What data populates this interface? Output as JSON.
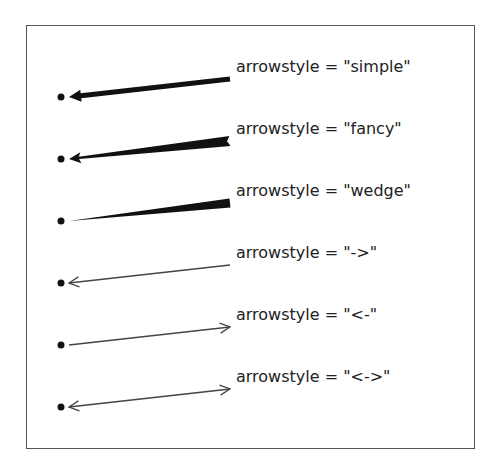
{
  "figure": {
    "rows": [
      {
        "style": "simple",
        "label": "arrowstyle = \"simple\"",
        "head": "start",
        "kind": "filled-arrow"
      },
      {
        "style": "fancy",
        "label": "arrowstyle = \"fancy\"",
        "head": "start",
        "kind": "fancy"
      },
      {
        "style": "wedge",
        "label": "arrowstyle = \"wedge\"",
        "head": "none",
        "kind": "wedge"
      },
      {
        "style": "->",
        "label": "arrowstyle = \"->\"",
        "head": "start",
        "kind": "line"
      },
      {
        "style": "<-",
        "label": "arrowstyle = \"<-\"",
        "head": "end",
        "kind": "line"
      },
      {
        "style": "<->",
        "label": "arrowstyle = \"<->\"",
        "head": "both",
        "kind": "line"
      }
    ],
    "colors": {
      "arrow": "#111111",
      "thin_arrow": "#444444",
      "text": "#222222",
      "frame": "#555555"
    }
  }
}
